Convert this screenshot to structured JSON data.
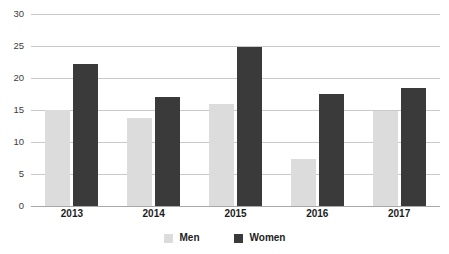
{
  "chart_data": {
    "type": "bar",
    "title": "",
    "subtitle": "",
    "xlabel": "",
    "ylabel": "",
    "categories": [
      "2013",
      "2014",
      "2015",
      "2016",
      "2017"
    ],
    "series": [
      {
        "name": "Men",
        "color": "#dcdcdc",
        "values": [
          15.0,
          13.7,
          16.0,
          7.4,
          14.8
        ]
      },
      {
        "name": "Women",
        "color": "#3a3a3a",
        "values": [
          22.2,
          17.0,
          24.8,
          17.5,
          18.5
        ]
      }
    ],
    "ylim": [
      0,
      30
    ],
    "y_ticks": [
      0,
      5,
      10,
      15,
      20,
      25,
      30
    ],
    "y_tick_labels": [
      "0",
      "5",
      "10",
      "15",
      "20",
      "25",
      "30"
    ],
    "grid": true,
    "grid_axis": "y",
    "grid_color": "#c9c9c9",
    "axis_color": "#a8a8a8",
    "legend_position": "bottom",
    "background_color": "#ffffff"
  },
  "legend": {
    "items": [
      {
        "label": "Men",
        "swatch": "men-swatch"
      },
      {
        "label": "Women",
        "swatch": "women-swatch"
      }
    ]
  }
}
